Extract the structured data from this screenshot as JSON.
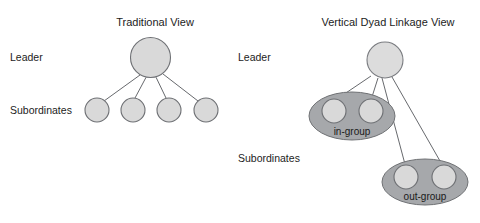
{
  "figure": {
    "title_left": "Traditional View",
    "title_right": "Vertical Dyad Linkage View",
    "background_color": "#ffffff"
  },
  "left_panel": {
    "title": "Traditional View",
    "labels": {
      "leader": "Leader",
      "subordinates": "Subordinates"
    },
    "leader_node": {
      "name": "leader-node",
      "cx": 150.5,
      "cy": 57.5,
      "r": 20,
      "fill": "#d9d9d9",
      "stroke": "#6e7074"
    },
    "subordinate_nodes": [
      {
        "name": "subordinate-node-1",
        "cx": 97,
        "cy": 110,
        "r": 12
      },
      {
        "name": "subordinate-node-2",
        "cx": 133,
        "cy": 110,
        "r": 12
      },
      {
        "name": "subordinate-node-3",
        "cx": 169,
        "cy": 110,
        "r": 12
      },
      {
        "name": "subordinate-node-4",
        "cx": 206,
        "cy": 110,
        "r": 12
      }
    ],
    "links": [
      {
        "from": "leader-node",
        "to": "subordinate-node-1"
      },
      {
        "from": "leader-node",
        "to": "subordinate-node-2"
      },
      {
        "from": "leader-node",
        "to": "subordinate-node-3"
      },
      {
        "from": "leader-node",
        "to": "subordinate-node-4"
      }
    ]
  },
  "right_panel": {
    "title": "Vertical Dyad Linkage View",
    "labels": {
      "leader": "Leader",
      "subordinates": "Subordinates"
    },
    "leader_node": {
      "name": "leader-node",
      "cx": 385,
      "cy": 60,
      "r": 18,
      "fill": "#dcdcdc",
      "stroke": "#7a7c80"
    },
    "groups": [
      {
        "name": "in-group",
        "label": "in-group",
        "cx": 352,
        "cy": 116,
        "rx": 43,
        "ry": 24,
        "fill": "#a6a8ab",
        "label_x": 352,
        "label_y": 132,
        "members": [
          {
            "name": "in-group-member-1",
            "cx": 334,
            "cy": 111,
            "r": 12
          },
          {
            "name": "in-group-member-2",
            "cx": 371,
            "cy": 111,
            "r": 12
          }
        ]
      },
      {
        "name": "out-group",
        "label": "out-group",
        "cx": 425,
        "cy": 182,
        "rx": 43,
        "ry": 23,
        "fill": "#a6a8ab",
        "label_x": 425,
        "label_y": 197,
        "members": [
          {
            "name": "out-group-member-1",
            "cx": 406,
            "cy": 177,
            "r": 12
          },
          {
            "name": "out-group-member-2",
            "cx": 444,
            "cy": 177,
            "r": 12
          }
        ]
      }
    ],
    "links": [
      {
        "from": "leader-node",
        "to": "in-group-member-1"
      },
      {
        "from": "leader-node",
        "to": "in-group-member-2"
      },
      {
        "from": "leader-node",
        "to": "out-group-member-1"
      },
      {
        "from": "leader-node",
        "to": "out-group-member-2"
      }
    ]
  }
}
